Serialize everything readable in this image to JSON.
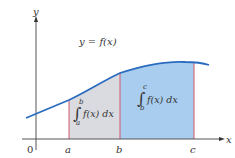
{
  "diagram": {
    "curve_label": "y = f(x)",
    "axes": {
      "x_label": "x",
      "y_label": "y",
      "origin_label": "0"
    },
    "points": [
      {
        "name": "a",
        "label": "a"
      },
      {
        "name": "b",
        "label": "b"
      },
      {
        "name": "c",
        "label": "c"
      }
    ],
    "regions": [
      {
        "name": "a-to-b",
        "integral": {
          "upper": "b",
          "lower": "a",
          "body": "f(x) dx"
        },
        "fill": "#d9dbe0"
      },
      {
        "name": "b-to-c",
        "integral": {
          "upper": "c",
          "lower": "b",
          "body": "f(x) dx"
        },
        "fill": "#a9cdef"
      }
    ],
    "colors": {
      "curve": "#2a6bbf",
      "bounds": "#d0566a",
      "axis": "#333333",
      "region_ab": "#d9dbe0",
      "region_bc": "#a9cdef"
    }
  }
}
